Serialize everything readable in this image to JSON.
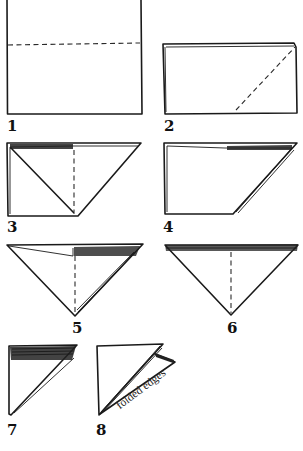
{
  "diagram": {
    "type": "folding-instructions",
    "steps": [
      {
        "number": "1",
        "description": "square sheet with horizontal dashed fold line"
      },
      {
        "number": "2",
        "description": "folded rectangle with diagonal dashed fold line"
      },
      {
        "number": "3",
        "description": "left half folded with dashed vertical line"
      },
      {
        "number": "4",
        "description": "folded trapezoid"
      },
      {
        "number": "5",
        "description": "inverted triangle with dashed center line"
      },
      {
        "number": "6",
        "description": "inverted triangle with folded top band and dashed center line"
      },
      {
        "number": "7",
        "description": "right triangle with folded top band"
      },
      {
        "number": "8",
        "description": "triangle with open flap"
      }
    ],
    "annotation": "folded edges",
    "colors": {
      "line": "#1a1a1a",
      "background": "#ffffff"
    }
  }
}
